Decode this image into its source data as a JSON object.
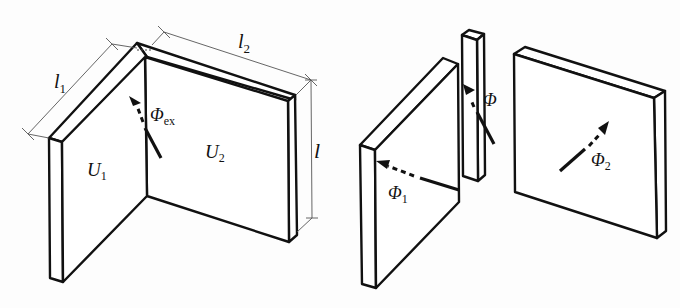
{
  "figure": {
    "left_panel": {
      "title": "Corner wall assembly",
      "labels": {
        "l1": {
          "main": "l",
          "sub": "1"
        },
        "l2": {
          "main": "l",
          "sub": "2"
        },
        "l": {
          "main": "l"
        },
        "U1": {
          "main": "U",
          "sub": "1"
        },
        "U2": {
          "main": "U",
          "sub": "2"
        },
        "phi_ex": {
          "main": "Φ",
          "sub": "ex"
        }
      }
    },
    "right_panel": {
      "title": "Decomposed elements",
      "labels": {
        "phi": {
          "main": "Φ"
        },
        "phi1": {
          "main": "Φ",
          "sub": "1"
        },
        "phi2": {
          "main": "Φ",
          "sub": "2"
        }
      }
    },
    "colors": {
      "line": "#111111",
      "dimension": "#555555",
      "background": "#fdfdfd"
    }
  }
}
